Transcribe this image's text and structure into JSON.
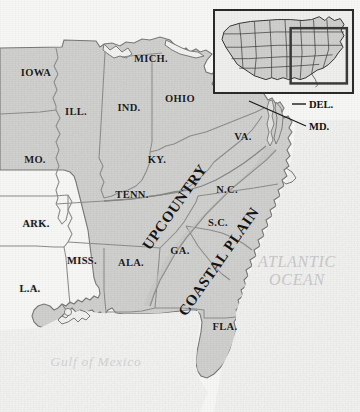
{
  "figure": {
    "kind": "historical-reference-map"
  },
  "colors": {
    "background": "#f7f7f6",
    "land_fill": "#d4d4d2",
    "land_fill_light": "#dcdcda",
    "border_line": "#8d8d8d",
    "coast_line": "#7c7c7c",
    "region_divider": "#8a8a8a",
    "label_text": "#1b1b1b",
    "water_text": "#c9c9c9",
    "inset_frame": "#2b2b2b",
    "inset_highlight": "#3a3a3a"
  },
  "state_labels": [
    {
      "name": "iowa",
      "text": "IOWA",
      "x": 36,
      "y": 72
    },
    {
      "name": "mich",
      "text": "MICH.",
      "x": 151,
      "y": 58
    },
    {
      "name": "ill",
      "text": "ILL.",
      "x": 76,
      "y": 111
    },
    {
      "name": "ind",
      "text": "IND.",
      "x": 129,
      "y": 107
    },
    {
      "name": "ohio",
      "text": "OHIO",
      "x": 180,
      "y": 98
    },
    {
      "name": "mo",
      "text": "MO.",
      "x": 35,
      "y": 159
    },
    {
      "name": "ky",
      "text": "KY.",
      "x": 157,
      "y": 159
    },
    {
      "name": "va",
      "text": "VA.",
      "x": 243,
      "y": 136
    },
    {
      "name": "tenn",
      "text": "TENN.",
      "x": 132,
      "y": 194
    },
    {
      "name": "nc",
      "text": "N.C.",
      "x": 227,
      "y": 189
    },
    {
      "name": "ark",
      "text": "ARK.",
      "x": 36,
      "y": 223
    },
    {
      "name": "sc",
      "text": "S.C.",
      "x": 218,
      "y": 222
    },
    {
      "name": "miss",
      "text": "MISS.",
      "x": 82,
      "y": 260
    },
    {
      "name": "ala",
      "text": "ALA.",
      "x": 131,
      "y": 262
    },
    {
      "name": "ga",
      "text": "GA.",
      "x": 180,
      "y": 250
    },
    {
      "name": "la",
      "text": "L.A.",
      "x": 30,
      "y": 288
    },
    {
      "name": "fla",
      "text": "FLA.",
      "x": 225,
      "y": 326
    }
  ],
  "callouts": [
    {
      "name": "delaware",
      "text": "DEL.",
      "x": 309,
      "y": 104,
      "leader": "short-horizontal"
    },
    {
      "name": "maryland",
      "text": "MD.",
      "x": 309,
      "y": 126,
      "leader": "long-diagonal"
    }
  ],
  "region_labels": [
    {
      "name": "upcountry",
      "text": "UPCOUNTRY",
      "x": 146,
      "y": 240,
      "rotate": -55,
      "style": "all-caps"
    },
    {
      "name": "coastal-plain",
      "text": "COASTAL PLAIN",
      "x": 182,
      "y": 306,
      "rotate": -55,
      "style": "small-caps"
    }
  ],
  "water_labels": [
    {
      "name": "atlantic-ocean",
      "line1": "ATLANTIC",
      "line2": "OCEAN",
      "x": 297,
      "y": 271
    },
    {
      "name": "gulf-of-mexico",
      "text": "Gulf of Mexico",
      "x": 96,
      "y": 362
    }
  ],
  "inset": {
    "name": "locator-inset",
    "description": "Continental United States locator map",
    "highlight_region": "eastern-united-states"
  }
}
